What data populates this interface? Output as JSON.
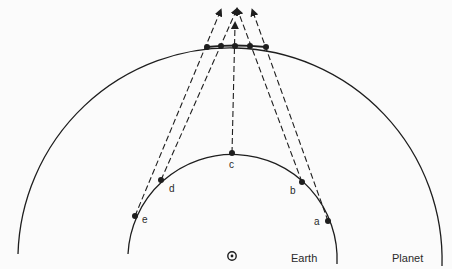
{
  "diagram": {
    "type": "heliocentric-retrograde-geometry",
    "bodies": {
      "earth_label": "Earth",
      "planet_label": "Planet",
      "sun_symbol": "⊙"
    },
    "earth_positions": [
      {
        "label": "a",
        "x": 328,
        "y": 221,
        "label_x": 314,
        "label_y": 217
      },
      {
        "label": "b",
        "x": 302,
        "y": 182,
        "label_x": 290,
        "label_y": 186
      },
      {
        "label": "c",
        "x": 232,
        "y": 153,
        "label_x": 229,
        "label_y": 160
      },
      {
        "label": "d",
        "x": 161,
        "y": 180,
        "label_x": 169,
        "label_y": 184
      },
      {
        "label": "e",
        "x": 135,
        "y": 216,
        "label_x": 142,
        "label_y": 215
      }
    ],
    "planet_positions": [
      {
        "x": 207,
        "y": 47
      },
      {
        "x": 221,
        "y": 46
      },
      {
        "x": 235,
        "y": 46
      },
      {
        "x": 250,
        "y": 46
      },
      {
        "x": 266,
        "y": 47
      }
    ],
    "sight_lines": [
      {
        "from": "e",
        "x1": 135,
        "y1": 216,
        "x2": 220,
        "y2": 12
      },
      {
        "from": "d",
        "x1": 161,
        "y1": 180,
        "x2": 236,
        "y2": 11
      },
      {
        "from": "c",
        "x1": 232,
        "y1": 153,
        "x2": 235,
        "y2": 25
      },
      {
        "from": "b",
        "x1": 302,
        "y1": 182,
        "x2": 238,
        "y2": 11
      },
      {
        "from": "a",
        "x1": 328,
        "y1": 221,
        "x2": 253,
        "y2": 12
      }
    ],
    "colors": {
      "ink": "#1e1e1e",
      "background": "#fbfbfb"
    }
  }
}
